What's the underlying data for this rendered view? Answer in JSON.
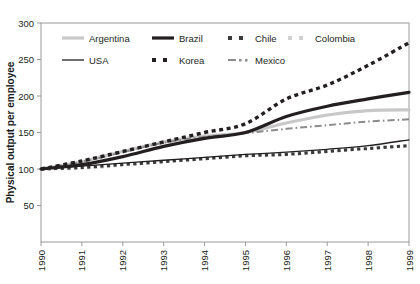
{
  "chart_data": {
    "type": "line",
    "title": "",
    "xlabel": "",
    "ylabel": "Physical output per employee",
    "x": [
      1990,
      1991,
      1992,
      1993,
      1994,
      1995,
      1996,
      1997,
      1998,
      1999
    ],
    "xtick_labels": [
      "1990",
      "1991",
      "1992",
      "1993",
      "1994",
      "1995",
      "1996",
      "1997",
      "1998",
      "1999"
    ],
    "ytick_labels": [
      "50",
      "100",
      "150",
      "200",
      "250",
      "300"
    ],
    "ytick_values": [
      50,
      100,
      150,
      200,
      250,
      300
    ],
    "ylim": [
      0,
      300
    ],
    "xlim": [
      1990,
      1999
    ],
    "grid": false,
    "legend_position": "top-left-inside",
    "series": [
      {
        "name": "Argentina",
        "color": "#c8c8c8",
        "style": "solid-thick",
        "values": [
          100,
          110,
          124,
          137,
          145,
          150,
          163,
          174,
          180,
          181
        ]
      },
      {
        "name": "Brazil",
        "color": "#231f20",
        "style": "solid-thick",
        "values": [
          100,
          106,
          117,
          131,
          142,
          150,
          172,
          186,
          196,
          205
        ]
      },
      {
        "name": "Chile",
        "color": "#3a3a3a",
        "style": "dotted-square",
        "values": [
          100,
          102,
          106,
          110,
          114,
          118,
          120,
          124,
          128,
          132
        ]
      },
      {
        "name": "Colombia",
        "color": "#d0d0d0",
        "style": "dotted-square",
        "values": [
          100,
          101,
          105,
          110,
          115,
          119,
          121,
          125,
          130,
          131
        ]
      },
      {
        "name": "USA",
        "color": "#231f20",
        "style": "solid-thin",
        "values": [
          100,
          104,
          108,
          112,
          116,
          120,
          123,
          127,
          132,
          140
        ]
      },
      {
        "name": "Korea",
        "color": "#231f20",
        "style": "dotted-square-large",
        "values": [
          100,
          111,
          124,
          137,
          150,
          162,
          196,
          215,
          242,
          273
        ]
      },
      {
        "name": "Mexico",
        "color": "#8c8c8c",
        "style": "dash-dot",
        "values": [
          100,
          110,
          123,
          136,
          144,
          149,
          155,
          160,
          165,
          168
        ]
      }
    ]
  },
  "legend": {
    "row1": [
      {
        "label": "Argentina",
        "marker": "solid-thick",
        "color": "#c8c8c8"
      },
      {
        "label": "Brazil",
        "marker": "solid-thick",
        "color": "#231f20"
      },
      {
        "label": "Chile",
        "marker": "dotted-square",
        "color": "#3a3a3a"
      },
      {
        "label": "Colombia",
        "marker": "dotted-square",
        "color": "#d0d0d0"
      }
    ],
    "row2": [
      {
        "label": "USA",
        "marker": "solid-thin",
        "color": "#231f20"
      },
      {
        "label": "Korea",
        "marker": "dotted-square",
        "color": "#231f20"
      },
      {
        "label": "Mexico",
        "marker": "dash-dot",
        "color": "#8c8c8c"
      }
    ]
  },
  "axes": {
    "frame_color": "#9a9a9a",
    "tick_color": "#9a9a9a"
  }
}
